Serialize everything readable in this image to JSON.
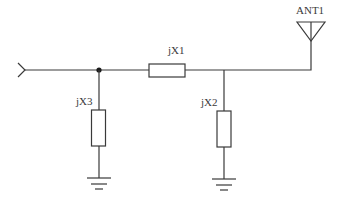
{
  "diagram": {
    "type": "circuit-schematic",
    "components": [
      {
        "id": "jX1",
        "label": "jX1",
        "kind": "series-reactance"
      },
      {
        "id": "jX2",
        "label": "jX2",
        "kind": "shunt-reactance-to-ground"
      },
      {
        "id": "jX3",
        "label": "jX3",
        "kind": "shunt-reactance-to-ground"
      },
      {
        "id": "ANT1",
        "label": "ANT1",
        "kind": "antenna"
      }
    ],
    "input": {
      "kind": "input-port",
      "icon": "input-arrow-icon"
    },
    "grounds": [
      {
        "attached_to": "jX3",
        "icon": "ground-icon"
      },
      {
        "attached_to": "jX2",
        "icon": "ground-icon"
      }
    ],
    "junctions": [
      {
        "between": [
          "input",
          "jX1",
          "jX3"
        ],
        "dot": true
      },
      {
        "between": [
          "jX1",
          "jX2",
          "ANT1"
        ],
        "dot": false
      }
    ],
    "colors": {
      "line": "#3a3a3a",
      "background": "#ffffff"
    }
  }
}
